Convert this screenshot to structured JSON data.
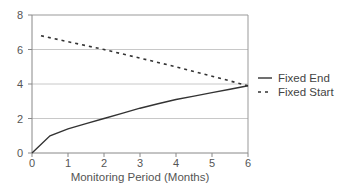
{
  "chart_data": {
    "type": "line",
    "title": "",
    "xlabel": "Monitoring Period (Months)",
    "ylabel": "",
    "xlim": [
      0,
      6
    ],
    "ylim": [
      0,
      8
    ],
    "x_ticks": [
      "0",
      "1",
      "2",
      "3",
      "4",
      "5",
      "6"
    ],
    "y_ticks": [
      "0",
      "2",
      "4",
      "6",
      "8"
    ],
    "grid": "horizontal",
    "legend_position": "right",
    "series": [
      {
        "name": "Fixed End",
        "style": "solid",
        "x": [
          0,
          0.5,
          1,
          1.5,
          2,
          2.5,
          3,
          3.5,
          4,
          4.5,
          5,
          5.5,
          6
        ],
        "values": [
          0,
          1.0,
          1.4,
          1.7,
          2.0,
          2.3,
          2.6,
          2.85,
          3.1,
          3.3,
          3.5,
          3.7,
          3.9
        ]
      },
      {
        "name": "Fixed Start",
        "style": "dashed",
        "x": [
          0.25,
          1,
          2,
          3,
          4,
          5,
          6
        ],
        "values": [
          6.8,
          6.45,
          6.0,
          5.5,
          5.0,
          4.45,
          3.9
        ]
      }
    ]
  }
}
